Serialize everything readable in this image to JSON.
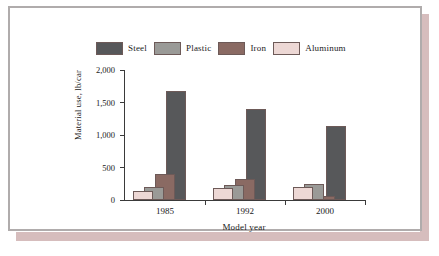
{
  "chart_data": {
    "type": "bar",
    "title": "",
    "xlabel": "Model year",
    "ylabel": "Material use, lb/car",
    "categories": [
      "1985",
      "1992",
      "2000"
    ],
    "ylim": [
      0,
      2000
    ],
    "yticks": [
      "0",
      "500",
      "1,000",
      "1,500",
      "2,000"
    ],
    "ytick_values": [
      0,
      500,
      1000,
      1500,
      2000
    ],
    "grid": false,
    "legend_position": "top",
    "series": [
      {
        "name": "Aluminum",
        "color": "#edd8d5",
        "values": [
          145,
          180,
          200
        ]
      },
      {
        "name": "Plastic",
        "color": "#9a9a97",
        "values": [
          200,
          230,
          250
        ]
      },
      {
        "name": "Iron",
        "color": "#8a6a63",
        "values": [
          400,
          330,
          60
        ]
      },
      {
        "name": "Steel",
        "color": "#57585a",
        "values": [
          1680,
          1400,
          1140
        ]
      }
    ]
  },
  "legend": {
    "entries": [
      {
        "label": "Steel",
        "color": "#57585a"
      },
      {
        "label": "Plastic",
        "color": "#9a9a97"
      },
      {
        "label": "Iron",
        "color": "#8a6a63"
      },
      {
        "label": "Aluminum",
        "color": "#edd8d5"
      }
    ]
  }
}
